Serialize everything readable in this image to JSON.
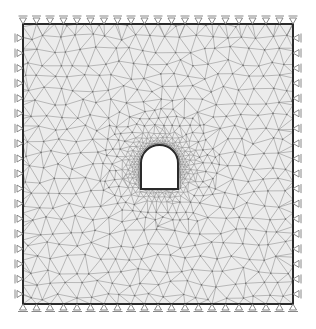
{
  "figure": {
    "width": 316,
    "height": 329
  },
  "domain_box": {
    "x0": 23,
    "y0": 24,
    "x1": 293,
    "y1": 304,
    "fill": "#ececec",
    "border_color": "#2b2b2b",
    "border_width": 2
  },
  "mesh": {
    "line_color": "#8a8a8a",
    "line_width": 0.55,
    "node_color": "#6f6f6f",
    "coarse_spacing": 15,
    "refine_radius": 60,
    "seed": 7
  },
  "tunnel": {
    "cx": 159.5,
    "left": 141,
    "right": 178,
    "arch_top": 145,
    "spring_line": 163,
    "bottom": 189,
    "fill": "#ffffff",
    "lining_color": "#2a2a2a",
    "lining_width": 2
  },
  "supports": {
    "color": "#7a7a7a",
    "top": {
      "type": "roller-vertical",
      "count": 21
    },
    "bottom": {
      "type": "pin",
      "count": 21
    },
    "left": {
      "type": "roller-horizontal",
      "count": 18
    },
    "right": {
      "type": "roller-horizontal",
      "count": 18
    }
  }
}
